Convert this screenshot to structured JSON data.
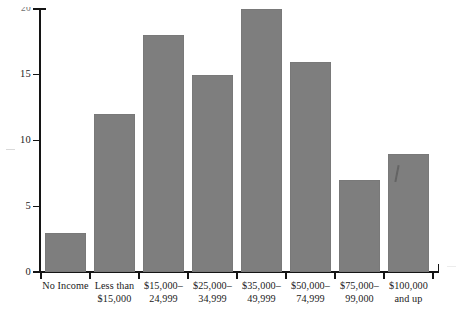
{
  "chart_data": {
    "type": "bar",
    "title": "",
    "subtitle": "",
    "xlabel": "",
    "ylabel": "",
    "ylim": [
      0,
      20
    ],
    "y_ticks": [
      "0",
      "5",
      "10",
      "15",
      "20"
    ],
    "y_tick_values": [
      0,
      5,
      10,
      15,
      20
    ],
    "grid": false,
    "legend": false,
    "bar_color": "#7e7e7e",
    "axis_color": "#141414",
    "background_color": "#ffffff",
    "top_label_clipped": true,
    "categories": [
      "No Income",
      "Less than $15,000",
      "$15,000–24,999",
      "$25,000–34,999",
      "$35,000–49,999",
      "$50,000–74,999",
      "$75,000–99,000",
      "$100,000 and up"
    ],
    "category_lines": [
      [
        "No Income",
        ""
      ],
      [
        "Less than",
        "$15,000"
      ],
      [
        "$15,000–",
        "24,999"
      ],
      [
        "$25,000–",
        "34,999"
      ],
      [
        "$35,000–",
        "49,999"
      ],
      [
        "$50,000–",
        "74,999"
      ],
      [
        "$75,000–",
        "99,000"
      ],
      [
        "$100,000",
        "and up"
      ]
    ],
    "values": [
      3,
      12,
      18,
      15,
      20,
      16,
      7,
      9
    ]
  }
}
